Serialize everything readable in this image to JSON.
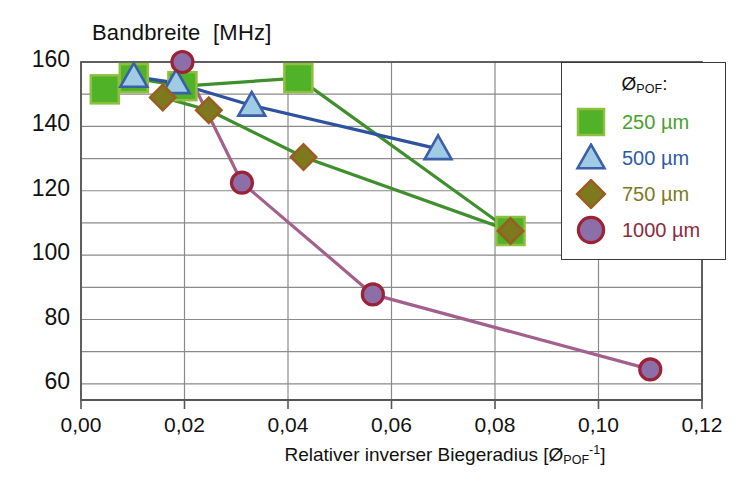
{
  "chart_data": {
    "type": "line",
    "title": "",
    "ylabel": "Bandbreite  [MHz]",
    "xlabel_prefix": "Relativer inverser Biegeradius [Ø",
    "xlabel_sub": "POF",
    "xlabel_sup": "-1",
    "xlabel_suffix": "]",
    "xlabel_plain": "Relativer inverser Biegeradius [ØPOF-1]",
    "xlim": [
      0.0,
      0.12
    ],
    "ylim": [
      55,
      160
    ],
    "xticks": [
      "0,00",
      "0,02",
      "0,04",
      "0,06",
      "0,08",
      "0,10",
      "0,12"
    ],
    "xtick_values": [
      0.0,
      0.02,
      0.04,
      0.06,
      0.08,
      0.1,
      0.12
    ],
    "yticks": [
      "160",
      "140",
      "120",
      "100",
      "80",
      "60"
    ],
    "ytick_values": [
      160,
      140,
      120,
      100,
      80,
      60
    ],
    "y_minor_values": [
      150,
      130,
      110,
      90,
      70
    ],
    "grid": true,
    "legend_position": "top-right",
    "legend_title": "ØPOF:",
    "legend_title_main": "Ø",
    "legend_title_sub": "POF",
    "legend_title_colon": ":",
    "series": [
      {
        "name": "250 µm",
        "marker": "square",
        "color": "#4aa02c",
        "fill": "#4fb227",
        "edge": "#8fbf3f",
        "line_color": "#3f8f2c",
        "x": [
          0.0046,
          0.0102,
          0.0196,
          0.042,
          0.083
        ],
        "y": [
          151.5,
          155.0,
          152.5,
          155.0,
          107.5
        ]
      },
      {
        "name": "500 µm",
        "marker": "triangle",
        "color": "#2f5aa8",
        "fill": "#9fcbe4",
        "edge": "#3b5fa8",
        "line_color": "#2f52a0",
        "x": [
          0.0102,
          0.0184,
          0.033,
          0.069
        ],
        "y": [
          155.5,
          153.5,
          146.5,
          133.0
        ]
      },
      {
        "name": "750 µm",
        "marker": "diamond",
        "color": "#7d7a1e",
        "fill": "#7d7a1e",
        "edge": "#9a5d22",
        "line_color": "#3f8f2c",
        "x": [
          0.0158,
          0.0247,
          0.043,
          0.083
        ],
        "y": [
          149.0,
          145.0,
          130.5,
          107.5
        ]
      },
      {
        "name": "1000 µm",
        "marker": "circle",
        "color": "#8c2b3d",
        "fill": "#8c6fa8",
        "edge": "#9b2335",
        "line_color": "#a3608c",
        "x": [
          0.0196,
          0.0311,
          0.0564,
          0.11
        ],
        "y": [
          160.0,
          122.5,
          87.8,
          64.5
        ]
      }
    ]
  },
  "plot_area": {
    "left": 81,
    "right": 702,
    "top": 62,
    "bottom": 400,
    "border_color": "#555555",
    "grid_color": "#8a8a8a",
    "background": "#ffffff"
  }
}
